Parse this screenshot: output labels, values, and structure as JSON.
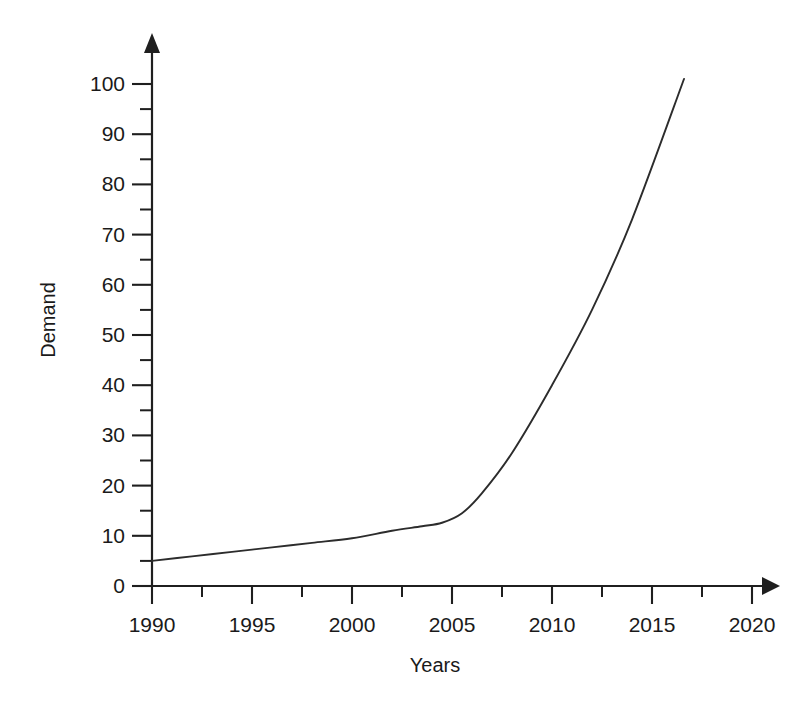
{
  "chart_data": {
    "type": "line",
    "title": "",
    "xlabel": "Years",
    "ylabel": "Demand",
    "xlim": [
      1990,
      2020
    ],
    "ylim": [
      0,
      100
    ],
    "grid": false,
    "legend": false,
    "x_ticks": [
      1990,
      1995,
      2000,
      2005,
      2010,
      2015,
      2020
    ],
    "x_tick_labels": [
      "1990",
      "1995",
      "2000",
      "2005",
      "2010",
      "2015",
      "2020"
    ],
    "x_minor_ticks": [
      1992.5,
      1997.5,
      2002.5,
      2007.5,
      2012.5,
      2017.5
    ],
    "y_ticks": [
      0,
      10,
      20,
      30,
      40,
      50,
      60,
      70,
      80,
      90,
      100
    ],
    "y_tick_labels": [
      "0",
      "10",
      "20",
      "30",
      "40",
      "50",
      "60",
      "70",
      "80",
      "90",
      "100"
    ],
    "y_minor_ticks": [
      5,
      15,
      25,
      35,
      45,
      55,
      65,
      75,
      85,
      95
    ],
    "series": [
      {
        "name": "Demand",
        "color": "#2c2c2c",
        "x": [
          1990,
          1992,
          1994,
          1996,
          1998,
          2000,
          2002,
          2003.5,
          2004.5,
          2005.5,
          2006.5,
          2008,
          2010,
          2012,
          2014,
          2016.6
        ],
        "values": [
          5.0,
          5.9,
          6.8,
          7.7,
          8.6,
          9.5,
          11.0,
          11.9,
          12.6,
          14.5,
          18.5,
          26.5,
          40.0,
          55.0,
          73.0,
          101.0
        ]
      }
    ],
    "annotations": []
  },
  "axis": {
    "y_arrow": "arrow-up-icon",
    "x_arrow": "arrow-right-icon"
  }
}
